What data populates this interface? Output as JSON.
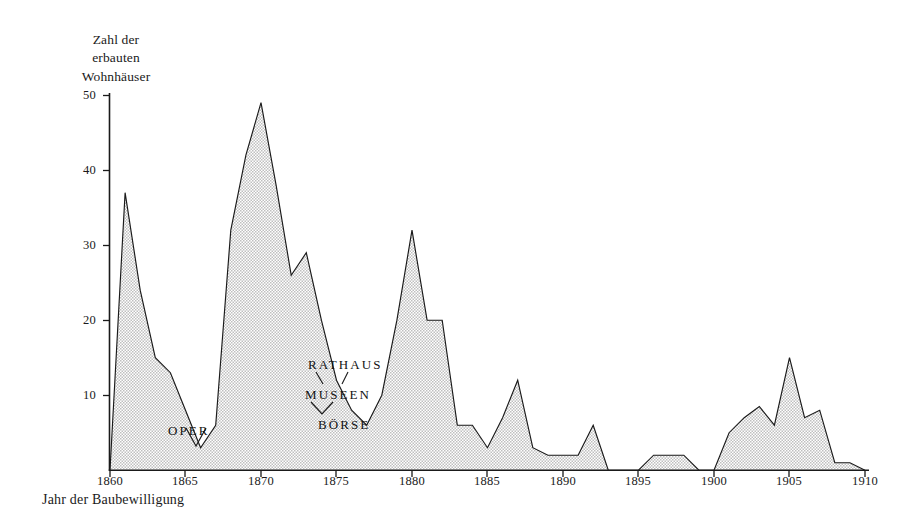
{
  "figure": {
    "background_color": "#ffffff",
    "line_color": "#1a1a1a",
    "fill_color": "#d9d9d9"
  },
  "axes": {
    "ylabel_lines": [
      "Zahl der",
      "erbauten",
      "Wohnhäuser"
    ],
    "xlabel": "Jahr der Baubewilligung",
    "yticks": [
      10,
      20,
      30,
      40,
      50
    ],
    "ytick_labels": [
      "10",
      "20",
      "30",
      "40",
      "50"
    ],
    "xticks": [
      1860,
      1865,
      1870,
      1875,
      1880,
      1885,
      1890,
      1895,
      1900,
      1905,
      1910
    ],
    "xtick_labels": [
      "1860",
      "1865",
      "1870",
      "1875",
      "1880",
      "1885",
      "1890",
      "1895",
      "1900",
      "1905",
      "1910"
    ]
  },
  "annotations": [
    {
      "name": "oper",
      "text": "OPER",
      "year": 1866,
      "value": 3
    },
    {
      "name": "rathaus",
      "text": "RATHAUS",
      "year": 1874,
      "value": 16
    },
    {
      "name": "museen",
      "text": "MUSEEN",
      "year": 1876,
      "value": 12
    },
    {
      "name": "boerse",
      "text": "BÖRSE",
      "year": 1877,
      "value": 8
    }
  ],
  "chart_data": {
    "type": "area",
    "title": "",
    "xlabel": "Jahr der Baubewilligung",
    "ylabel": "Zahl der erbauten Wohnhäuser",
    "xlim": [
      1860,
      1910
    ],
    "ylim": [
      0,
      52
    ],
    "grid": false,
    "legend": "none",
    "x": [
      1860,
      1861,
      1862,
      1863,
      1864,
      1865,
      1866,
      1867,
      1868,
      1869,
      1870,
      1871,
      1872,
      1873,
      1874,
      1875,
      1876,
      1877,
      1878,
      1879,
      1880,
      1881,
      1882,
      1883,
      1884,
      1885,
      1886,
      1887,
      1888,
      1889,
      1890,
      1891,
      1892,
      1893,
      1894,
      1895,
      1896,
      1897,
      1898,
      1899,
      1900,
      1901,
      1902,
      1903,
      1904,
      1905,
      1906,
      1907,
      1908,
      1909,
      1910
    ],
    "values": [
      0,
      37,
      24,
      15,
      13,
      8,
      3,
      6,
      32,
      42,
      49,
      38,
      26,
      29,
      20,
      12,
      8,
      6,
      10,
      20,
      32,
      20,
      20,
      6,
      6,
      3,
      7,
      12,
      3,
      2,
      2,
      2,
      6,
      0,
      0,
      0,
      2,
      2,
      2,
      0,
      0,
      5,
      7,
      8.5,
      6,
      15,
      7,
      8,
      1,
      1,
      0
    ]
  }
}
